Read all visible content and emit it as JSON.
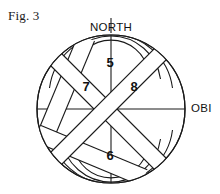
{
  "figure": {
    "caption": "Fig. 3",
    "type": "patent-line-drawing"
  },
  "diagram": {
    "compass_labels": [
      {
        "name": "north-label",
        "text": "NORTH",
        "x": 111,
        "y": 31,
        "anchor": "middle"
      },
      {
        "name": "obi-label",
        "text": "OBI",
        "x": 191,
        "y": 112,
        "anchor": "start"
      }
    ],
    "reference_numerals": [
      {
        "name": "numeral-5",
        "text": "5",
        "x": 110,
        "y": 67
      },
      {
        "name": "numeral-7",
        "text": "7",
        "x": 86,
        "y": 91
      },
      {
        "name": "numeral-8",
        "text": "8",
        "x": 134,
        "y": 91
      },
      {
        "name": "numeral-6",
        "text": "6",
        "x": 110,
        "y": 160
      }
    ],
    "geometry": {
      "center_x": 111,
      "center_y": 109,
      "outer_radius": 74,
      "arc_radii": [
        74,
        62,
        50,
        38
      ],
      "strap_half_width": 9,
      "stroke_color": "#1a1a1a",
      "fill_color": "#ffffff",
      "stroke_width": 1.1
    }
  }
}
